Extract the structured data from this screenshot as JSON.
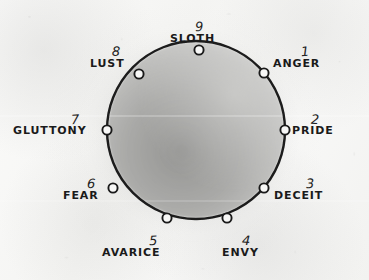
{
  "diagram": {
    "type": "enneagram-circle",
    "paper_color": "#f7f7f6",
    "ink_color": "#1a1a1a",
    "interior_shade_color": "#9f9f9d",
    "circle": {
      "center_x": 196,
      "center_y": 130,
      "radius": 89,
      "stroke_width": 2.3
    },
    "points": [
      {
        "number": "1",
        "name": "ANGER",
        "angle_deg": 40,
        "node_x": 264,
        "node_y": 73,
        "num_x": 301,
        "num_y": 42,
        "label_x": 273,
        "label_y": 57,
        "align": "left"
      },
      {
        "number": "2",
        "name": "PRIDE",
        "angle_deg": 0,
        "node_x": 285,
        "node_y": 130,
        "num_x": 311,
        "num_y": 110,
        "label_x": 292,
        "label_y": 124,
        "align": "left"
      },
      {
        "number": "3",
        "name": "DECEIT",
        "angle_deg": -40,
        "node_x": 264,
        "node_y": 188,
        "num_x": 306,
        "num_y": 174,
        "label_x": 274,
        "label_y": 189,
        "align": "left"
      },
      {
        "number": "4",
        "name": "ENVY",
        "angle_deg": -80,
        "node_x": 227,
        "node_y": 218,
        "num_x": 242,
        "num_y": 231,
        "label_x": 222,
        "label_y": 246,
        "align": "left"
      },
      {
        "number": "5",
        "name": "AVARICE",
        "angle_deg": -120,
        "node_x": 167,
        "node_y": 218,
        "num_x": 149,
        "num_y": 231,
        "label_x": 102,
        "label_y": 246,
        "align": "left"
      },
      {
        "number": "6",
        "name": "FEAR",
        "angle_deg": -160,
        "node_x": 113,
        "node_y": 188,
        "num_x": 87,
        "num_y": 174,
        "label_x": 63,
        "label_y": 189,
        "align": "left"
      },
      {
        "number": "7",
        "name": "GLUTTONY",
        "angle_deg": 180,
        "node_x": 107,
        "node_y": 130,
        "num_x": 71,
        "num_y": 110,
        "label_x": 13,
        "label_y": 124,
        "align": "left"
      },
      {
        "number": "8",
        "name": "LUST",
        "angle_deg": 140,
        "node_x": 139,
        "node_y": 74,
        "num_x": 112,
        "num_y": 42,
        "label_x": 90,
        "label_y": 57,
        "align": "left"
      },
      {
        "number": "9",
        "name": "SLOTH",
        "angle_deg": 90,
        "node_x": 199,
        "node_y": 50,
        "num_x": 195,
        "num_y": 17,
        "label_x": 170,
        "label_y": 32,
        "align": "left"
      }
    ]
  }
}
